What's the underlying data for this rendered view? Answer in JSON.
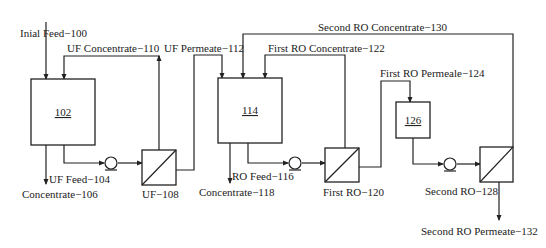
{
  "diagram": {
    "colors": {
      "stroke": "#222222",
      "background": "#ffffff",
      "text": "#222222"
    },
    "streams": {
      "initial_feed": "Inial Feed−100",
      "uf_concentrate": "UF Concentrate−110",
      "uf_permeate": "UF Permeate−112",
      "second_ro_concentrate": "Second RO Concentrate−130",
      "first_ro_concentrate": "First RO Concentrate−122",
      "first_ro_permeate": "First RO Permeale−124",
      "uf_feed": "UF Feed−104",
      "concentrate_106": "Concentrate−106",
      "ro_feed": "RO Feed−116",
      "concentrate_118": "Concentrate−118",
      "second_ro_permeate": "Second RO Permeate−132"
    },
    "units": {
      "tank_102": "102",
      "tank_114": "114",
      "tank_126": "126",
      "uf_108": "UF−108",
      "first_ro_120": "First RO−120",
      "second_ro_128": "Second RO−128"
    },
    "icons": {
      "tank": "rectangle-vessel",
      "membrane": "square-with-diagonal",
      "pump": "circle-pump"
    }
  }
}
